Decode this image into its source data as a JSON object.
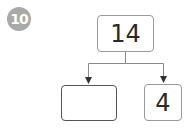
{
  "problem": {
    "number": "10",
    "badge_color": "#a9a9a9"
  },
  "diagram": {
    "type": "number-bond",
    "whole": "14",
    "parts": [
      {
        "value": "",
        "blank": true
      },
      {
        "value": "4",
        "blank": false
      }
    ],
    "line_color": "#8a8a8a"
  }
}
